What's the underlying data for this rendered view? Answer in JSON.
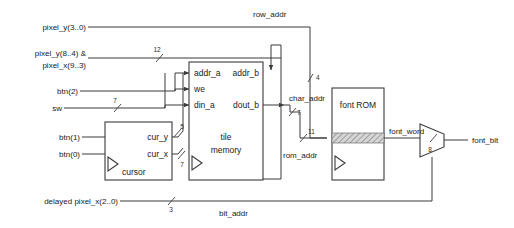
{
  "diagram": {
    "canvas": {
      "width": 514,
      "height": 228
    },
    "colors": {
      "background": "#ffffff",
      "wire": "#3a3a3a",
      "text": "#1a1a1a",
      "hatch": "#9a9a9a"
    },
    "blocks": [
      {
        "id": "tile-memory",
        "label_line1": "tile",
        "label_line2": "memory",
        "inputs": [
          "addr_a",
          "we",
          "din_a"
        ],
        "outputs": [
          "addr_b",
          "dout_b"
        ],
        "clocked": true
      },
      {
        "id": "cursor",
        "label": "cursor",
        "inputs": [],
        "outputs": [
          "cur_y",
          "cur_x"
        ],
        "clocked": true
      },
      {
        "id": "font-rom",
        "label": "font ROM",
        "clocked": true
      },
      {
        "id": "font-mux",
        "label": "",
        "type": "multiplexer"
      }
    ],
    "ports": {
      "addr_a": "addr_a",
      "we": "we",
      "din_a": "din_a",
      "addr_b": "addr_b",
      "dout_b": "dout_b",
      "cur_y": "cur_y",
      "cur_x": "cur_x",
      "tile_memory_line1": "tile",
      "tile_memory_line2": "memory",
      "cursor": "cursor",
      "font_rom": "font ROM"
    },
    "signals": {
      "pixel_y_3_0": "pixel_y(3..0)",
      "pixel_y_8_4": "pixel_y(8..4) &",
      "pixel_x_9_3": "pixel_x(9..3)",
      "btn2": "btn(2)",
      "sw": "sw",
      "btn1": "btn(1)",
      "btn0": "btn(0)",
      "delayed_pixel_x": "delayed pixel_x(2..0)",
      "row_addr": "row_addr",
      "char_addr": "char_addr",
      "rom_addr": "rom_addr",
      "font_word": "font_word",
      "font_bit": "font_bit",
      "bit_addr": "bit_addr"
    },
    "bus_widths": {
      "pixel_y_concat": "12",
      "sw": "7",
      "cur_y": "5",
      "cur_x": "7",
      "row_addr": "4",
      "char_addr": "7",
      "rom_addr": "11",
      "font_word": "8",
      "bit_addr": "3"
    }
  }
}
